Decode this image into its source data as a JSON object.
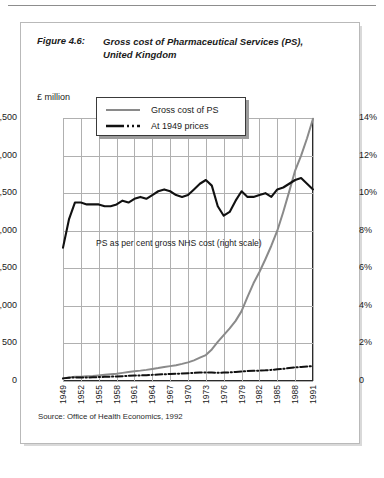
{
  "figure": {
    "label": "Figure 4.6:",
    "title_line1": "Gross cost of Pharmaceutical Services (PS),",
    "title_line2": "United Kingdom",
    "source": "Source: Office of Health Economics, 1992",
    "annotation": "PS as per cent gross NHS cost (right scale)"
  },
  "legend": {
    "items": [
      {
        "label": "Gross cost of PS",
        "style": "solid",
        "color": "#8a8a8a"
      },
      {
        "label": "At 1949 prices",
        "style": "dash-dot",
        "color": "#111111"
      }
    ]
  },
  "axes": {
    "left_label": "£ million",
    "left_ticks": [
      "3,500",
      "3,000",
      "2,500",
      "2,000",
      "1,500",
      "1,000",
      "500",
      "0"
    ],
    "right_ticks": [
      "14%",
      "12%",
      "10%",
      "8%",
      "6%",
      "4%",
      "2%",
      "0"
    ],
    "x_ticks": [
      "1949",
      "1952",
      "1955",
      "1958",
      "1961",
      "1964",
      "1967",
      "1970",
      "1973",
      "1976",
      "1979",
      "1982",
      "1985",
      "1988",
      "1991"
    ]
  },
  "chart_data": {
    "type": "line",
    "title": "Gross cost of Pharmaceutical Services (PS), United Kingdom",
    "xlabel": "",
    "ylabel": "£ million",
    "y2label": "per cent of gross NHS cost",
    "ylim": [
      0,
      3500
    ],
    "y2lim": [
      0,
      14
    ],
    "xlim": [
      1949,
      1991
    ],
    "grid": true,
    "legend_position": "top-center",
    "x": [
      1949,
      1950,
      1951,
      1952,
      1953,
      1954,
      1955,
      1956,
      1957,
      1958,
      1959,
      1960,
      1961,
      1962,
      1963,
      1964,
      1965,
      1966,
      1967,
      1968,
      1969,
      1970,
      1971,
      1972,
      1973,
      1974,
      1975,
      1976,
      1977,
      1978,
      1979,
      1980,
      1981,
      1982,
      1983,
      1984,
      1985,
      1986,
      1987,
      1988,
      1989,
      1990,
      1991
    ],
    "series": [
      {
        "name": "Gross cost of PS",
        "axis": "left",
        "unit": "£ million",
        "color": "#8a8a8a",
        "style": "solid",
        "values": [
          35,
          48,
          55,
          58,
          62,
          66,
          74,
          82,
          90,
          97,
          108,
          120,
          130,
          138,
          148,
          160,
          172,
          186,
          198,
          210,
          228,
          248,
          275,
          310,
          345,
          420,
          520,
          610,
          700,
          800,
          930,
          1120,
          1300,
          1450,
          1620,
          1800,
          2000,
          2250,
          2520,
          2800,
          3000,
          3230,
          3490
        ]
      },
      {
        "name": "At 1949 prices",
        "axis": "left",
        "unit": "£ million",
        "color": "#111111",
        "style": "dash-dot",
        "values": [
          35,
          44,
          48,
          46,
          47,
          49,
          52,
          55,
          58,
          60,
          64,
          69,
          72,
          74,
          78,
          82,
          86,
          90,
          93,
          96,
          100,
          104,
          108,
          112,
          114,
          112,
          110,
          112,
          115,
          120,
          126,
          132,
          135,
          138,
          142,
          148,
          155,
          162,
          172,
          182,
          186,
          192,
          198
        ]
      },
      {
        "name": "PS as per cent gross NHS cost (right scale)",
        "axis": "right",
        "unit": "%",
        "color": "#111111",
        "style": "solid",
        "values": [
          7.1,
          8.6,
          9.5,
          9.5,
          9.4,
          9.4,
          9.4,
          9.3,
          9.3,
          9.4,
          9.6,
          9.5,
          9.7,
          9.8,
          9.7,
          9.9,
          10.1,
          10.2,
          10.1,
          9.9,
          9.8,
          9.9,
          10.2,
          10.5,
          10.7,
          10.4,
          9.3,
          8.8,
          9.0,
          9.6,
          10.1,
          9.8,
          9.8,
          9.9,
          10.0,
          9.8,
          10.2,
          10.3,
          10.5,
          10.7,
          10.8,
          10.5,
          10.2
        ]
      }
    ]
  }
}
